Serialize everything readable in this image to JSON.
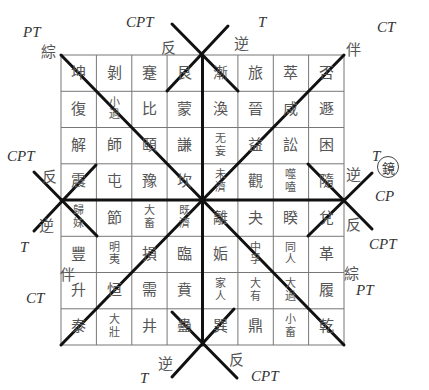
{
  "grid": {
    "rows": [
      [
        "坤",
        "剝",
        "蹇",
        "艮",
        "漸",
        "旅",
        "萃",
        "否"
      ],
      [
        "復",
        "小\n過",
        "比",
        "蒙",
        "渙",
        "晉",
        "咸",
        "遯"
      ],
      [
        "解",
        "師",
        "頤",
        "謙",
        "无\n妄",
        "益",
        "訟",
        "困"
      ],
      [
        "震",
        "屯",
        "豫",
        "坎",
        "未\n濟",
        "觀",
        "噬\n嗑",
        "隨"
      ],
      [
        "歸\n妹",
        "節",
        "大\n畜",
        "既\n濟",
        "離",
        "夬",
        "睽",
        "兌"
      ],
      [
        "豐",
        "明\n夷",
        "損",
        "臨",
        "姤",
        "中\n孚",
        "同\n人",
        "革"
      ],
      [
        "升",
        "恒",
        "需",
        "賁",
        "家\n人",
        "大\n有",
        "大\n過",
        "履"
      ],
      [
        "泰",
        "大\n壯",
        "井",
        "蠱",
        "巽",
        "鼎",
        "小\n畜",
        "乾"
      ]
    ]
  },
  "labels": {
    "top_left_PT": "PT",
    "top_left_zong": "綜",
    "top_CPT": "CPT",
    "top_fan": "反",
    "top_T": "T",
    "top_ni": "逆",
    "top_right_CT": "CT",
    "top_right_ban": "伴",
    "left_CPT": "CPT",
    "left_fan": "反",
    "left_ni": "逆",
    "left_T": "T",
    "left_ban": "伴",
    "left_CT": "CT",
    "right_T": "T",
    "right_ni": "逆",
    "right_mirror": "鏡",
    "right_CP": "CP",
    "right_fan": "反",
    "right_CPT": "CPT",
    "right_zong": "綜",
    "right_PT": "PT",
    "bottom_ni": "逆",
    "bottom_T": "T",
    "bottom_fan": "反",
    "bottom_CPT": "CPT"
  },
  "colors": {
    "grid_line": "#666666",
    "bold_line": "#111111",
    "text": "#555555"
  }
}
